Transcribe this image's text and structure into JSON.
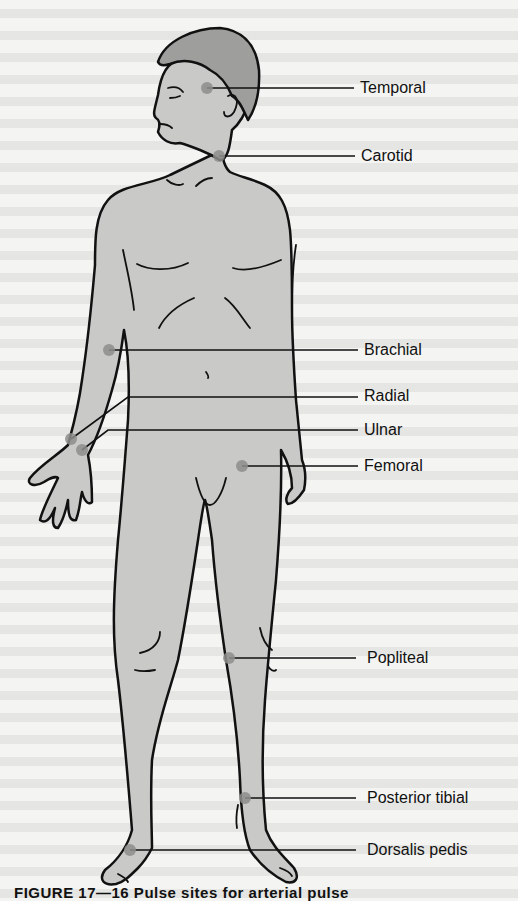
{
  "figure": {
    "title": "Pulse sites",
    "caption": "FIGURE 17—16  Pulse sites for arterial pulse",
    "colors": {
      "skin": "#c9c9c7",
      "hair": "#9e9e9c",
      "outline": "#111111",
      "pulse_dot": "#8e8e8c",
      "background": "#f4f4f2"
    },
    "pulse_sites": [
      {
        "label": "Temporal",
        "dot": [
          207,
          88
        ],
        "line_y": 88,
        "label_x": 360,
        "label_y": 79
      },
      {
        "label": "Carotid",
        "dot": [
          219,
          156
        ],
        "line_y": 156,
        "label_x": 361,
        "label_y": 147
      },
      {
        "label": "Brachial",
        "dot": [
          109,
          350
        ],
        "line_y": 350,
        "label_x": 364,
        "label_y": 341
      },
      {
        "label": "Radial",
        "dot": [
          71,
          439
        ],
        "line_y": 396,
        "label_x": 364,
        "label_y": 387
      },
      {
        "label": "Ulnar",
        "dot": [
          82,
          450
        ],
        "line_y": 430,
        "label_x": 364,
        "label_y": 421
      },
      {
        "label": "Femoral",
        "dot": [
          242,
          466
        ],
        "line_y": 466,
        "label_x": 364,
        "label_y": 457
      },
      {
        "label": "Popliteal",
        "dot": [
          229,
          658
        ],
        "line_y": 658,
        "label_x": 367,
        "label_y": 649
      },
      {
        "label": "Posterior tibial",
        "dot": [
          245,
          798
        ],
        "line_y": 798,
        "label_x": 367,
        "label_y": 789
      },
      {
        "label": "Dorsalis pedis",
        "dot": [
          130,
          850
        ],
        "line_y": 850,
        "label_x": 367,
        "label_y": 841
      }
    ]
  }
}
